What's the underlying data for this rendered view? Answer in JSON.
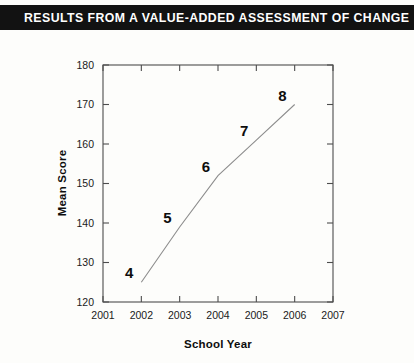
{
  "banner": {
    "title": "RESULTS FROM A VALUE-ADDED ASSESSMENT OF CHANGE"
  },
  "colors": {
    "banner_background": "#121212",
    "banner_text": "#ffffff",
    "page_background": "#fdfdfb",
    "axis": "#4d4d4d",
    "data_line": "#8d8d8d",
    "label_text": "#0d0d0d"
  },
  "chart_data": {
    "type": "line",
    "title": "",
    "xlabel": "School Year",
    "ylabel": "Mean Score",
    "x": [
      2002,
      2003,
      2004,
      2005,
      2006
    ],
    "values": [
      125,
      139,
      152,
      161,
      170
    ],
    "point_labels": [
      "4",
      "5",
      "6",
      "7",
      "8"
    ],
    "xlim": [
      2001,
      2007
    ],
    "ylim": [
      120,
      180
    ],
    "xticks": [
      "2001",
      "2002",
      "2003",
      "2004",
      "2005",
      "2006",
      "2007"
    ],
    "yticks": [
      "120",
      "130",
      "140",
      "150",
      "160",
      "170",
      "180"
    ],
    "grid": false,
    "legend": "none",
    "series": [
      {
        "name": "Mean Score by grade cohort",
        "values": [
          125,
          139,
          152,
          161,
          170
        ]
      }
    ]
  }
}
